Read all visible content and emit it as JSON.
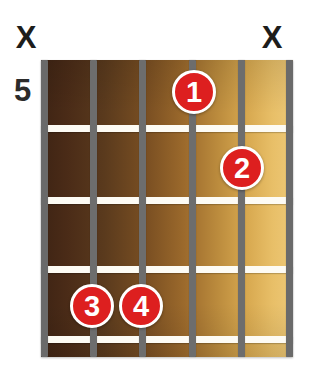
{
  "diagram": {
    "type": "guitar-chord-diagram",
    "fret_position_label": "5",
    "strings_count": 6,
    "frets_count": 4,
    "colors": {
      "dot_fill": "#dd1f1f",
      "dot_ring": "#ffffff",
      "string": "#6d6d6d",
      "fret_line": "#fdfbf4",
      "marker_text": "#1d1d1b",
      "board_dark": "#3e2414",
      "board_light": "#edc877",
      "background": "#ffffff"
    },
    "top_markers": [
      {
        "string": 1,
        "label": "X",
        "icon": "mute-x-icon",
        "x": 26
      },
      {
        "string": 6,
        "label": "X",
        "icon": "mute-x-icon",
        "x": 272
      }
    ],
    "finger_dots": [
      {
        "label": "1",
        "string": 4,
        "fret": 1,
        "x": 172,
        "y": 70
      },
      {
        "label": "2",
        "string": 5,
        "fret": 2,
        "x": 220,
        "y": 146
      },
      {
        "label": "3",
        "string": 2,
        "fret": 4,
        "x": 70,
        "y": 284
      },
      {
        "label": "4",
        "string": 3,
        "fret": 4,
        "x": 119,
        "y": 284
      }
    ],
    "string_positions_x": [
      41,
      90,
      139,
      189,
      238,
      286
    ],
    "fret_line_positions_y": [
      125,
      197,
      266,
      336
    ]
  }
}
